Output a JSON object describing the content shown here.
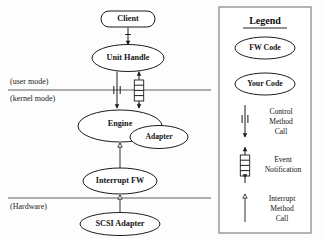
{
  "diagram": {
    "nodes": [
      {
        "id": "client",
        "label": "Client",
        "shape": "rounded-rect"
      },
      {
        "id": "unit_handle",
        "label": "Unit Handle",
        "shape": "ellipse"
      },
      {
        "id": "engine",
        "label": "Engine",
        "shape": "ellipse"
      },
      {
        "id": "adapter",
        "label": "Adapter",
        "shape": "ellipse"
      },
      {
        "id": "interrupt_fw",
        "label": "Interrupt FW",
        "shape": "ellipse"
      },
      {
        "id": "scsi_adapter",
        "label": "SCSI Adapter",
        "shape": "ellipse"
      }
    ],
    "boundaries": [
      {
        "id": "user_mode",
        "label": "(user mode)"
      },
      {
        "id": "kernel_mode",
        "label": "(kernel mode)"
      },
      {
        "id": "hardware",
        "label": "(Hardware)"
      }
    ],
    "edges": [
      {
        "from": "client",
        "to": "unit_handle",
        "kind": "control-method-call"
      },
      {
        "from": "unit_handle",
        "to": "engine",
        "kind": "control-method-call"
      },
      {
        "from": "engine",
        "to": "unit_handle",
        "kind": "event-notification"
      },
      {
        "from": "interrupt_fw",
        "to": "engine",
        "kind": "interrupt-method-call"
      },
      {
        "from": "scsi_adapter",
        "to": "interrupt_fw",
        "kind": "interrupt-method-call"
      }
    ]
  },
  "legend": {
    "title": "Legend",
    "shape_items": [
      {
        "id": "fw_code",
        "label": "FW Code"
      },
      {
        "id": "your_code",
        "label": "Your Code"
      }
    ],
    "edge_items": [
      {
        "id": "control_method_call",
        "label_lines": [
          "Control",
          "Method",
          "Call"
        ]
      },
      {
        "id": "event_notification",
        "label_lines": [
          "Event",
          "Notification"
        ]
      },
      {
        "id": "interrupt_method_call",
        "label_lines": [
          "Interrupt",
          "Method",
          "Call"
        ]
      }
    ]
  },
  "colors": {
    "background": "#fdfdfd",
    "stroke": "#1c1c1c",
    "rule": "#4a4a4a",
    "legend_border": "#777777",
    "text": "#151515"
  }
}
